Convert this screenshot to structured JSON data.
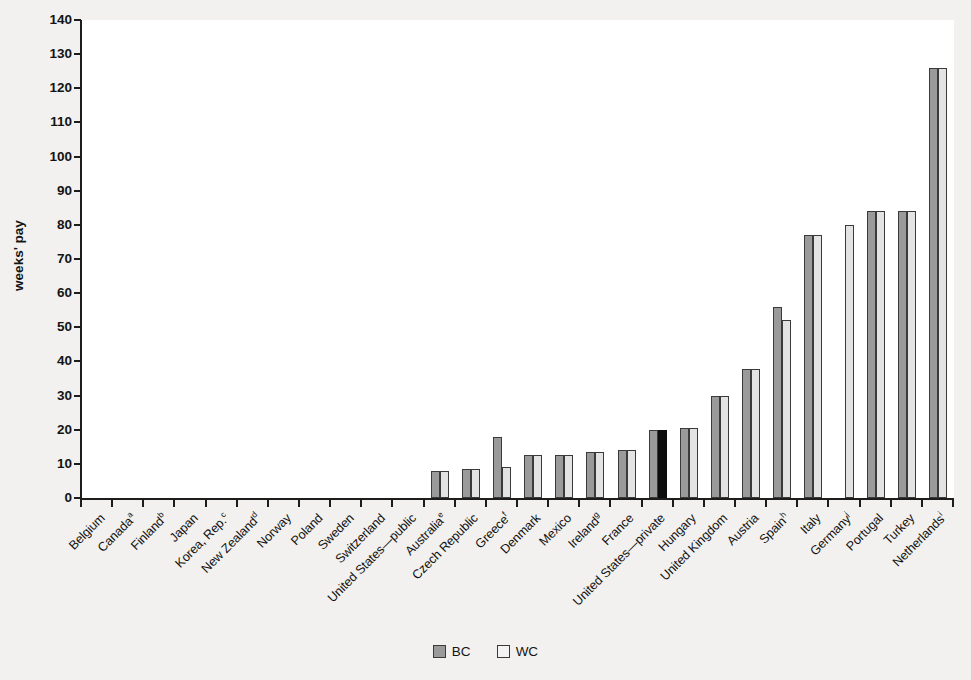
{
  "chart_data": {
    "type": "bar",
    "title": "",
    "xlabel": "",
    "ylabel": "weeks' pay",
    "ylim": [
      0,
      140
    ],
    "ytick_step": 10,
    "yticks": [
      "0",
      "10",
      "20",
      "30",
      "40",
      "50",
      "60",
      "70",
      "80",
      "90",
      "100",
      "110",
      "120",
      "130",
      "140"
    ],
    "grid": false,
    "legend_position": "bottom-center",
    "legend": [
      {
        "name": "BC",
        "color": "#9a9a9a"
      },
      {
        "name": "WC",
        "color": "#f3f3f3"
      }
    ],
    "categories": [
      "Belgium",
      "Canada",
      "Finland",
      "Japan",
      "Korea, Rep.",
      "New Zealand",
      "Norway",
      "Poland",
      "Sweden",
      "Switzerland",
      "United States—public",
      "Australia",
      "Czech Republic",
      "Greece",
      "Denmark",
      "Mexico",
      "Ireland",
      "France",
      "United States—private",
      "Hungary",
      "United Kingdom",
      "Austria",
      "Spain",
      "Italy",
      "Germany",
      "Portugal",
      "Turkey",
      "Netherlands"
    ],
    "category_footnotes": [
      "",
      "a",
      "b",
      "",
      "c",
      "d",
      "",
      "",
      "",
      "",
      "",
      "e",
      "",
      "f",
      "",
      "",
      "g",
      "",
      "",
      "",
      "",
      "",
      "h",
      "",
      "j",
      "",
      "",
      "i"
    ],
    "series": [
      {
        "name": "BC",
        "values": [
          0,
          0,
          0,
          0,
          0,
          0,
          0,
          0,
          0,
          0,
          0,
          8,
          8.5,
          18,
          12.7,
          12.7,
          13.5,
          14,
          20,
          20.6,
          29.8,
          37.8,
          56,
          77,
          0,
          84,
          84,
          126
        ]
      },
      {
        "name": "WC",
        "values": [
          0,
          0,
          0,
          0,
          0,
          0,
          0,
          0,
          0,
          0,
          0,
          8,
          8.5,
          9,
          12.7,
          12.7,
          13.5,
          14,
          20,
          20.6,
          29.8,
          37.8,
          52,
          77,
          80,
          84,
          84,
          126
        ]
      }
    ],
    "highlighted_bar": {
      "category": "United States—private",
      "series": "WC",
      "color": "#0d0d0d"
    }
  }
}
